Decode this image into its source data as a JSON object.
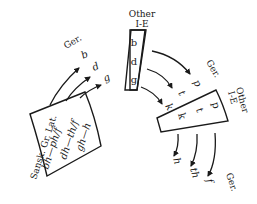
{
  "diagram": {
    "boxes": [
      {
        "id": "sanskrit-greek-latin",
        "label": "Sansk. Gr. Lat.",
        "rows": [
          "bh—ph/f",
          "dh—th/f",
          "gh—h"
        ]
      },
      {
        "id": "other-ie-voiced",
        "label_line1": "Other",
        "label_line2": "I-E",
        "rows": [
          "b",
          "d",
          "g"
        ]
      },
      {
        "id": "other-ie-voiceless",
        "label_line1": "Other",
        "label_line2": "I-E",
        "rows": [
          "p",
          "t",
          "k"
        ]
      }
    ],
    "shifts": [
      {
        "label": "Ger.",
        "targets": [
          "b",
          "d",
          "g"
        ]
      },
      {
        "label": "Ger.",
        "targets": [
          "p",
          "t",
          "k"
        ]
      },
      {
        "label": "Ger.",
        "targets": [
          "f",
          "th",
          "h"
        ]
      }
    ],
    "colors": {
      "ink": "#1a1a1a",
      "background": "#ffffff"
    }
  }
}
